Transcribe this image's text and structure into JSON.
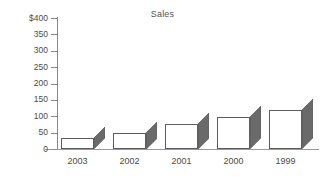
{
  "chart_data": {
    "type": "bar",
    "title": "Sales",
    "xlabel": "",
    "ylabel": "",
    "categories": [
      "2003",
      "2002",
      "2001",
      "2000",
      "1999"
    ],
    "values": [
      33,
      50,
      77,
      97,
      118
    ],
    "ylim": [
      0,
      400
    ],
    "ytick_labels": [
      "$400",
      "350",
      "300",
      "250",
      "200",
      "150",
      "100",
      "50",
      "0"
    ],
    "ytick_values": [
      400,
      350,
      300,
      250,
      200,
      150,
      100,
      50,
      0
    ],
    "grid": false,
    "legend": false,
    "style": "3d-bar",
    "colors": {
      "bar_face": "#ffffff",
      "bar_outline": "#5c5c5c",
      "bar_side": "#6a6a6a",
      "axis": "#8a8a8a",
      "text": "#4a4a4a",
      "background": "#ffffff"
    }
  }
}
